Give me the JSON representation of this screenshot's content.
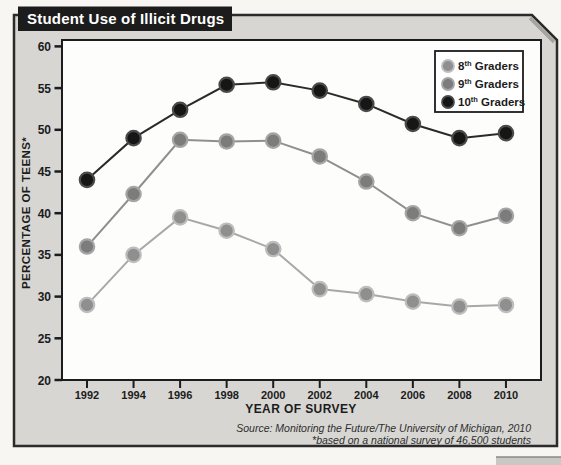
{
  "title": "Student Use of Illicit Drugs",
  "y_axis": {
    "label": "PERCENTAGE OF TEENS*",
    "ticks": [
      60,
      55,
      50,
      45,
      40,
      35,
      30,
      25,
      20
    ]
  },
  "x_axis": {
    "label": "YEAR OF SURVEY"
  },
  "source": {
    "line1": "Source: Monitoring the Future/The University of Michigan, 2010",
    "line2": "*based on a national survey of 46,500 students"
  },
  "legend": [
    {
      "prefix": "8",
      "sup": "th",
      "suffix": " Graders"
    },
    {
      "prefix": "9",
      "sup": "th",
      "suffix": " Graders"
    },
    {
      "prefix": "10",
      "sup": "th",
      "suffix": " Graders"
    }
  ],
  "colors": {
    "panel_fill": "#d7d6d2",
    "panel_border": "#2b2b2b",
    "title_box": "#1c1c1c",
    "plot_fill": "#fdfdfc",
    "grader8_marker": "#8f8f8f",
    "grader8_ring": "#bdbdbd",
    "grader8_line": "#a8a8a8",
    "grader9_marker": "#7c7c7c",
    "grader9_ring": "#a5a5a5",
    "grader9_line": "#8f8f8f",
    "grader10_marker": "#161616",
    "grader10_ring": "#4a4a4a",
    "grader10_line": "#2a2a2a"
  },
  "chart_data": {
    "type": "line",
    "title": "Student Use of Illicit Drugs",
    "xlabel": "YEAR OF SURVEY",
    "ylabel": "PERCENTAGE OF TEENS*",
    "ylim": [
      20,
      60
    ],
    "grid": false,
    "legend_position": "top-right",
    "categories": [
      1992,
      1994,
      1996,
      1998,
      2000,
      2002,
      2004,
      2006,
      2008,
      2010
    ],
    "series": [
      {
        "name": "8th Graders",
        "values": [
          29,
          35,
          39.5,
          37.9,
          35.7,
          30.9,
          30.3,
          29.4,
          28.8,
          29
        ]
      },
      {
        "name": "9th Graders",
        "values": [
          36,
          42.3,
          48.8,
          48.6,
          48.7,
          46.8,
          43.8,
          40,
          38.2,
          39.7
        ]
      },
      {
        "name": "10th Graders",
        "values": [
          44,
          49,
          52.4,
          55.4,
          55.7,
          54.7,
          53.1,
          50.7,
          49,
          49.6
        ]
      }
    ]
  }
}
